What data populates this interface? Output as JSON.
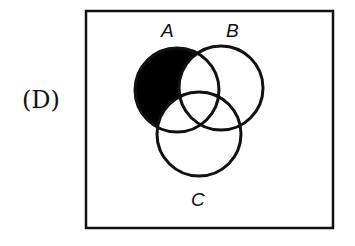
{
  "option_label": "(D)",
  "diagram": {
    "type": "venn",
    "sets": [
      {
        "name": "A",
        "label": "A"
      },
      {
        "name": "B",
        "label": "B"
      },
      {
        "name": "C",
        "label": "C"
      }
    ],
    "shaded_region": "A minus (B union C)",
    "colors": {
      "shade": "#000000",
      "stroke": "#111111",
      "background": "#ffffff"
    }
  }
}
